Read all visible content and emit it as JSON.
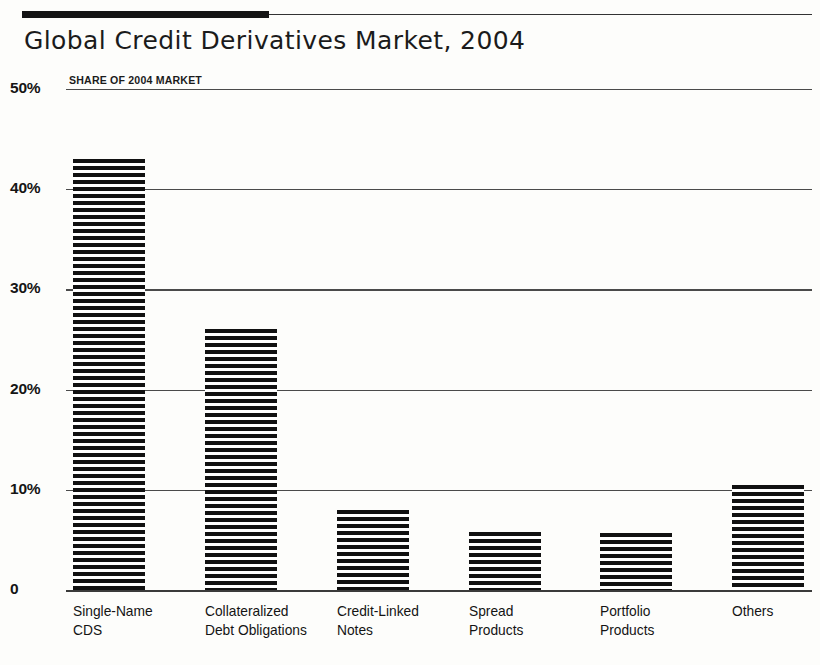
{
  "header": {
    "title": "Global Credit Derivatives Market, 2004",
    "top_rule_color": "#141414"
  },
  "chart_data": {
    "type": "bar",
    "title": "Global Credit Derivatives Market, 2004",
    "subtitle": "SHARE OF 2004 MARKET",
    "xlabel": "",
    "ylabel": "SHARE OF 2004 MARKET",
    "ylim": [
      0,
      50
    ],
    "grid": true,
    "legend": "none",
    "yticks": [
      {
        "value": 50,
        "label": "50%"
      },
      {
        "value": 40,
        "label": "40%"
      },
      {
        "value": 30,
        "label": "30%"
      },
      {
        "value": 20,
        "label": "20%"
      },
      {
        "value": 10,
        "label": "10%"
      },
      {
        "value": 0,
        "label": "0"
      }
    ],
    "categories": [
      "Single-Name\nCDS",
      "Collateralized\nDebt Obligations",
      "Credit-Linked\nNotes",
      "Spread\nProducts",
      "Portfolio\nProducts",
      "Others"
    ],
    "values": [
      43.0,
      26.0,
      8.0,
      5.8,
      5.7,
      10.5
    ],
    "bar_fill": "horizontal-hatch",
    "bar_color": "#111111"
  }
}
